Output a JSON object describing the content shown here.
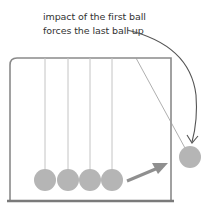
{
  "annotation": {
    "line1": "impact of the first ball",
    "line2": "forces the last ball up"
  },
  "diagram": {
    "resting_balls": 4,
    "lifted_balls": 1,
    "colors": {
      "ball": "#b5b5b5",
      "frame": "#8a8a8a",
      "string": "#bdbdbd",
      "arrow": "#8f8f8f",
      "curve": "#555555"
    }
  }
}
